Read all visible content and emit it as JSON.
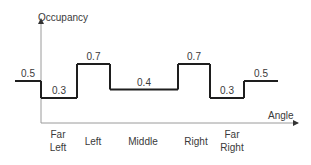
{
  "chart_data": {
    "type": "line",
    "subtype": "step",
    "title": "",
    "ylabel": "Occupancy",
    "xlabel": "Angle",
    "categories": [
      [
        "Far",
        "Left"
      ],
      [
        "Left"
      ],
      [
        "Middle"
      ],
      [
        "Right"
      ],
      [
        "Far",
        "Right"
      ]
    ],
    "segments": [
      {
        "region": "before",
        "value": 0.5,
        "label": "0.5"
      },
      {
        "region": "Far Left",
        "value": 0.3,
        "label": "0.3"
      },
      {
        "region": "Left",
        "value": 0.7,
        "label": "0.7"
      },
      {
        "region": "Middle",
        "value": 0.4,
        "label": "0.4"
      },
      {
        "region": "Right",
        "value": 0.7,
        "label": "0.7"
      },
      {
        "region": "Far Right",
        "value": 0.3,
        "label": "0.3"
      },
      {
        "region": "after",
        "value": 0.5,
        "label": "0.5"
      }
    ],
    "ylim": [
      0,
      1
    ],
    "grid": false,
    "legend": "none",
    "colors": {
      "line": "#1e1e1e",
      "axis": "#9a9a9a",
      "text": "#3a3a3a"
    }
  }
}
